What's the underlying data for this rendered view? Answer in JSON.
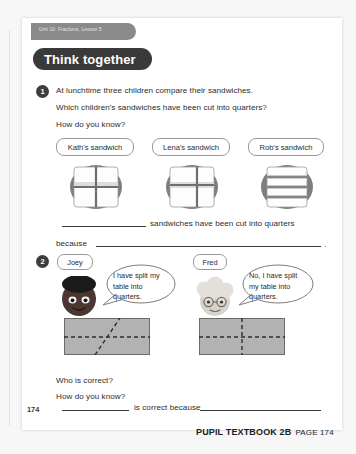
{
  "page": {
    "unit_tab": "Unit 10: Fractions, Lesson 5",
    "banner_title": "Think together",
    "page_number": "174"
  },
  "question1": {
    "number": "1",
    "line1": "At lunchtime three children compare their sandwiches.",
    "line2": "Which children's sandwiches have been cut into quarters?",
    "line3": "How do you know?",
    "sandwiches": [
      {
        "label": "Kath's sandwich",
        "cut": "quarters-cross"
      },
      {
        "label": "Lena's sandwich",
        "cut": "unequal-cross"
      },
      {
        "label": "Rob's sandwich",
        "cut": "horizontal-strips"
      }
    ],
    "answer_a_suffix": "sandwiches have been cut into quarters",
    "answer_b_prefix": "because",
    "answer_b_period": "."
  },
  "question2": {
    "number": "2",
    "speakers": [
      {
        "name": "Joey",
        "quote": "I have split my table into quarters.",
        "table_cut": "diagonal-and-horizontal"
      },
      {
        "name": "Fred",
        "quote": "No, I have split my table into quarters.",
        "table_cut": "vertical-and-horizontal"
      }
    ],
    "prompt1": "Who is correct?",
    "prompt2": "How do you know?",
    "answer_middle": "is correct because"
  },
  "footer": {
    "book": "PUPIL TEXTBOOK 2B",
    "page_label": "PAGE 174"
  },
  "colors": {
    "banner_bg": "#3a3a3a",
    "tab_bg": "#8a8a8a",
    "plate": "#808080",
    "bread": "#ffffff",
    "table_fill": "#b4b4b4",
    "rule": "#3a3a3a"
  }
}
